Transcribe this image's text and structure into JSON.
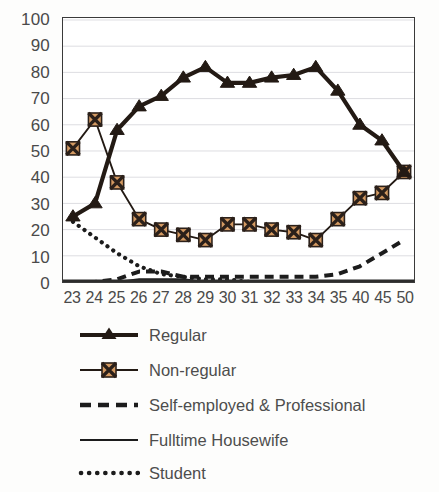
{
  "chart_data": {
    "type": "line",
    "title": "",
    "subtitle": "",
    "xlabel": "",
    "ylabel": "",
    "xlim": [
      0,
      15
    ],
    "ylim": [
      0,
      100
    ],
    "ytick_step": 10,
    "grid": true,
    "legend_position": "bottom-left",
    "categories": [
      "23",
      "24",
      "25",
      "26",
      "27",
      "28",
      "29",
      "30",
      "31",
      "32",
      "33",
      "34",
      "35",
      "40",
      "45",
      "50"
    ],
    "yticks": [
      "100",
      "90",
      "80",
      "70",
      "60",
      "50",
      "40",
      "30",
      "20",
      "10",
      "0"
    ],
    "series": [
      {
        "name": "Regular",
        "marker": "triangle",
        "line_style": "solid-thick",
        "color": "#231a14",
        "values": [
          25,
          30,
          58,
          67,
          71,
          78,
          82,
          76,
          76,
          78,
          79,
          82,
          73,
          60,
          54,
          42
        ]
      },
      {
        "name": "Non-regular",
        "marker": "square-x",
        "line_style": "solid",
        "color": "#231a14",
        "marker_fill": "#d49a62",
        "values": [
          51,
          62,
          38,
          24,
          20,
          18,
          16,
          22,
          22,
          20,
          19,
          16,
          24,
          32,
          34,
          42
        ]
      },
      {
        "name": "Self-employed & Professional",
        "marker": "none",
        "line_style": "dashed",
        "color": "#1c1c1c",
        "values": [
          0,
          0,
          1,
          4,
          4,
          2,
          2,
          2,
          2,
          2,
          2,
          2,
          3,
          6,
          11,
          16
        ]
      },
      {
        "name": "Fulltime Housewife",
        "marker": "none",
        "line_style": "solid-thin",
        "color": "#1c1c1c",
        "values": [
          0,
          0,
          0,
          1,
          1,
          1,
          0,
          0,
          0,
          0,
          0,
          0,
          0,
          0,
          0,
          0
        ]
      },
      {
        "name": "Student",
        "marker": "none",
        "line_style": "dotted",
        "color": "#1c1c1c",
        "values": [
          23,
          17,
          11,
          6,
          3,
          2,
          1,
          1,
          0,
          0,
          0,
          0,
          0,
          0,
          0,
          0
        ]
      }
    ]
  },
  "legend": {
    "items": [
      {
        "label": "Regular",
        "key": "line-triangle-marker-icon"
      },
      {
        "label": "Non-regular",
        "key": "line-square-x-marker-icon"
      },
      {
        "label": "Self-employed & Professional",
        "key": "dashed-line-icon"
      },
      {
        "label": "Fulltime Housewife",
        "key": "solid-line-icon"
      },
      {
        "label": "Student",
        "key": "dotted-line-icon"
      }
    ]
  },
  "colors": {
    "series_dark": "#231a14",
    "marker_fill": "#d49a62",
    "grid": "#d9d9dd",
    "axis": "#3a3a3a",
    "text": "#4a4a4a",
    "background": "#ffffff"
  }
}
